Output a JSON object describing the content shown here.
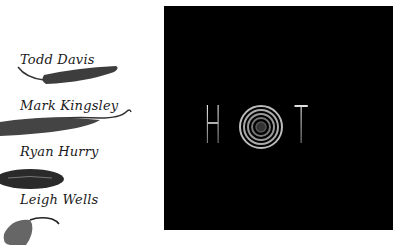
{
  "people": [
    {
      "name": "Todd Davis"
    },
    {
      "name": "Mark Kingsley"
    },
    {
      "name": "Ryan Hurry"
    },
    {
      "name": "Leigh Wells"
    }
  ],
  "logo": {
    "letter_left": "H",
    "letter_right": "T",
    "middle_icon": "spiral-o-icon"
  },
  "colors": {
    "panel_bg": "#000000",
    "page_bg": "#ffffff",
    "pepper": "#3a3a3a"
  }
}
